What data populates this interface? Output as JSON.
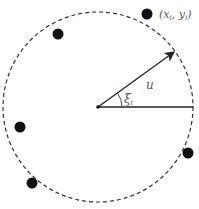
{
  "diagram": {
    "circle": {
      "cx": 98,
      "cy": 107,
      "r": 95,
      "style": "dashed"
    },
    "center": {
      "x": 98,
      "y": 107
    },
    "points": [
      {
        "x": 147,
        "y": 14,
        "label": "(x_i, y_i)"
      },
      {
        "x": 58,
        "y": 34
      },
      {
        "x": 20,
        "y": 127
      },
      {
        "x": 32,
        "y": 183
      },
      {
        "x": 188,
        "y": 153
      }
    ],
    "vector": {
      "label": "u",
      "x2": 175,
      "y2": 52
    },
    "angle": {
      "label": "ξ_i"
    },
    "labels": {
      "point": "(x",
      "point_sub_x": "i",
      "point_mid": ", y",
      "point_sub_y": "i",
      "point_end": ")",
      "vector": "u",
      "angle": "ξ",
      "angle_sub": "i"
    }
  }
}
